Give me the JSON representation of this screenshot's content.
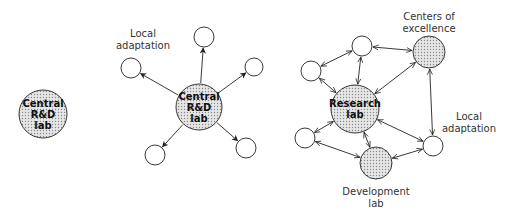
{
  "diagram": {
    "colors": {
      "stroke": "#222222",
      "fill_dotted_bg": "#e6e6e6",
      "dot": "#888888",
      "background": "#ffffff"
    },
    "panels": [
      {
        "id": "centralized",
        "nodes": [
          {
            "id": "a_central",
            "x": 43,
            "y": 114,
            "r": 24,
            "filled": true,
            "lines": [
              "Central",
              "R&D",
              "lab"
            ]
          }
        ],
        "edges": []
      },
      {
        "id": "hub",
        "nodes": [
          {
            "id": "b_central",
            "x": 199,
            "y": 107,
            "r": 23,
            "filled": true,
            "lines": [
              "Central",
              "R&D",
              "lab"
            ]
          },
          {
            "id": "b_top",
            "x": 204,
            "y": 37,
            "r": 10,
            "filled": false
          },
          {
            "id": "b_left",
            "x": 131,
            "y": 68,
            "r": 10,
            "filled": false
          },
          {
            "id": "b_right_top",
            "x": 254,
            "y": 67,
            "r": 9,
            "filled": false
          },
          {
            "id": "b_left_bottom",
            "x": 155,
            "y": 155,
            "r": 10,
            "filled": false
          },
          {
            "id": "b_right_bottom",
            "x": 246,
            "y": 148,
            "r": 10,
            "filled": false
          }
        ],
        "edges": [
          {
            "from": "b_central",
            "to": "b_top",
            "type": "one-way"
          },
          {
            "from": "b_central",
            "to": "b_left",
            "type": "one-way"
          },
          {
            "from": "b_central",
            "to": "b_right_top",
            "type": "one-way"
          },
          {
            "from": "b_central",
            "to": "b_left_bottom",
            "type": "one-way"
          },
          {
            "from": "b_central",
            "to": "b_right_bottom",
            "type": "one-way"
          }
        ],
        "labels": [
          {
            "id": "b_label_local",
            "text_lines": [
              "Local",
              "adaptation"
            ],
            "x": 143,
            "y": 28
          }
        ]
      },
      {
        "id": "network",
        "nodes": [
          {
            "id": "c_research",
            "x": 355,
            "y": 109,
            "r": 24,
            "filled": true,
            "lines": [
              "Research",
              "lab"
            ]
          },
          {
            "id": "c_top",
            "x": 362,
            "y": 46,
            "r": 10,
            "filled": false
          },
          {
            "id": "c_left_top",
            "x": 311,
            "y": 71,
            "r": 10,
            "filled": false
          },
          {
            "id": "c_left_bottom",
            "x": 305,
            "y": 138,
            "r": 10,
            "filled": false
          },
          {
            "id": "c_dev",
            "x": 376,
            "y": 163,
            "r": 16,
            "filled": true
          },
          {
            "id": "c_centers",
            "x": 429,
            "y": 52,
            "r": 16,
            "filled": true
          },
          {
            "id": "c_local",
            "x": 433,
            "y": 146,
            "r": 10,
            "filled": false
          }
        ],
        "edges": [
          {
            "from": "c_top",
            "to": "c_centers",
            "type": "two-way"
          },
          {
            "from": "c_top",
            "to": "c_left_top",
            "type": "two-way"
          },
          {
            "from": "c_top",
            "to": "c_research",
            "type": "two-way"
          },
          {
            "from": "c_research",
            "to": "c_centers",
            "type": "two-way"
          },
          {
            "from": "c_left_top",
            "to": "c_research",
            "type": "two-way"
          },
          {
            "from": "c_left_bottom",
            "to": "c_research",
            "type": "two-way"
          },
          {
            "from": "c_left_bottom",
            "to": "c_dev",
            "type": "two-way"
          },
          {
            "from": "c_research",
            "to": "c_dev",
            "type": "two-way"
          },
          {
            "from": "c_research",
            "to": "c_local",
            "type": "two-way"
          },
          {
            "from": "c_dev",
            "to": "c_local",
            "type": "two-way"
          },
          {
            "from": "c_centers",
            "to": "c_local",
            "type": "two-way"
          }
        ],
        "labels": [
          {
            "id": "c_label_centers",
            "text_lines": [
              "Centers of",
              "excellence"
            ],
            "x": 429,
            "y": 11
          },
          {
            "id": "c_label_local",
            "text_lines": [
              "Local",
              "adaptation"
            ],
            "x": 469,
            "y": 111
          },
          {
            "id": "c_label_dev",
            "text_lines": [
              "Development",
              "lab"
            ],
            "x": 376,
            "y": 186
          }
        ]
      }
    ]
  }
}
